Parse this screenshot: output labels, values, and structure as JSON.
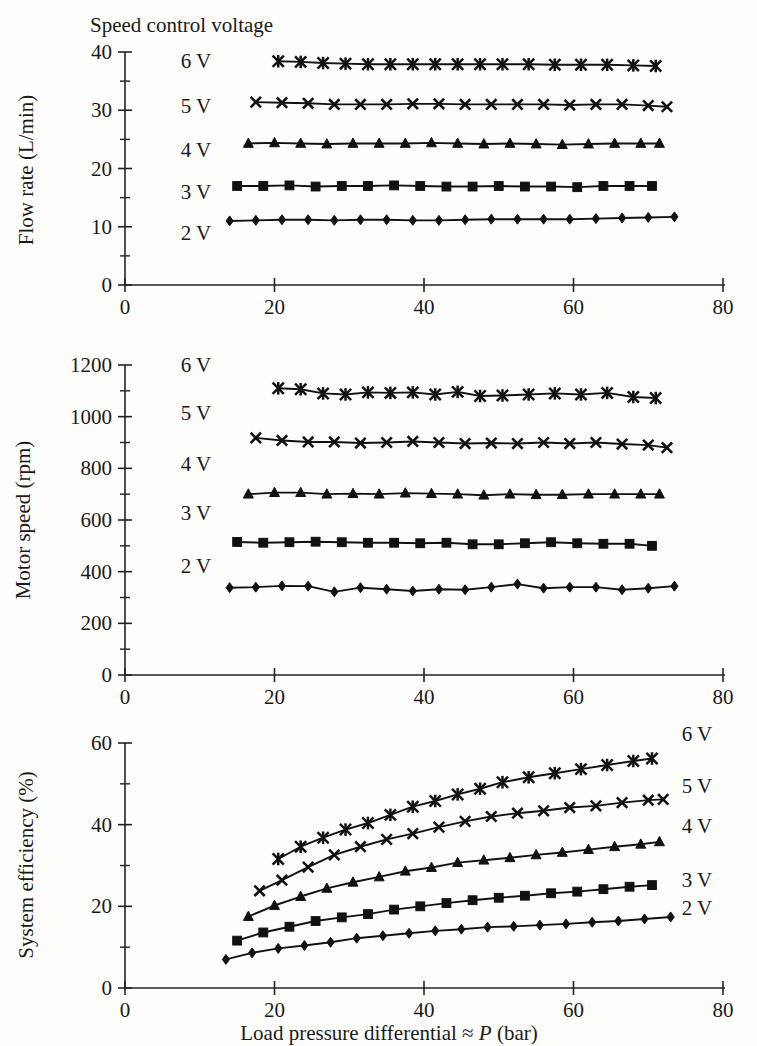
{
  "figure": {
    "legend_title": "Speed control voltage",
    "xlabel_parts": {
      "pre": "Load pressure differential ",
      "approx": "≈ ",
      "symbol": "P",
      "post": " (bar)"
    },
    "xlabel_full": "Load pressure differential ≈ P (bar)",
    "series_labels": [
      "2 V",
      "3 V",
      "4 V",
      "5 V",
      "6 V"
    ],
    "ink_color": "#111111"
  },
  "panels": {
    "flow": {
      "ylabel": "Flow rate (L/min)",
      "xticks": [
        "0",
        "20",
        "40",
        "60",
        "80"
      ],
      "yticks": [
        "0",
        "10",
        "20",
        "30",
        "40"
      ],
      "labels": {
        "v6": "6 V",
        "v5": "5 V",
        "v4": "4 V",
        "v3": "3 V",
        "v2": "2 V"
      }
    },
    "speed": {
      "ylabel": "Motor speed (rpm)",
      "xticks": [
        "0",
        "20",
        "40",
        "60",
        "80"
      ],
      "yticks": [
        "0",
        "200",
        "400",
        "600",
        "800",
        "1000",
        "1200"
      ],
      "labels": {
        "v6": "6 V",
        "v5": "5 V",
        "v4": "4 V",
        "v3": "3 V",
        "v2": "2 V"
      }
    },
    "efficiency": {
      "ylabel": "System efficiency (%)",
      "xticks": [
        "0",
        "20",
        "40",
        "60",
        "80"
      ],
      "yticks": [
        "0",
        "20",
        "40",
        "60"
      ],
      "labels": {
        "v6": "6 V",
        "v5": "5 V",
        "v4": "4 V",
        "v3": "3 V",
        "v2": "2 V"
      }
    }
  },
  "chart_data": [
    {
      "type": "line",
      "id": "flow",
      "title": "",
      "xlabel": "Load pressure differential ≈ P (bar)",
      "ylabel": "Flow rate (L/min)",
      "xlim": [
        0,
        80
      ],
      "ylim": [
        0,
        40
      ],
      "xticks": [
        0,
        20,
        40,
        60,
        80
      ],
      "yticks": [
        0,
        10,
        20,
        30,
        40
      ],
      "yminor_step": 5,
      "grid": false,
      "legend_position": "inside-left",
      "series": [
        {
          "name": "2 V",
          "marker": "diamond",
          "x": [
            14.0,
            17.5,
            21.0,
            24.5,
            28.0,
            31.5,
            35.0,
            38.5,
            42.0,
            45.5,
            49.0,
            52.5,
            56.0,
            59.5,
            63.0,
            66.5,
            70.0,
            73.5
          ],
          "y": [
            11.0,
            11.1,
            11.2,
            11.2,
            11.1,
            11.2,
            11.2,
            11.1,
            11.1,
            11.2,
            11.3,
            11.3,
            11.3,
            11.3,
            11.4,
            11.5,
            11.6,
            11.7
          ]
        },
        {
          "name": "3 V",
          "marker": "square",
          "x": [
            15.0,
            18.5,
            22.0,
            25.5,
            29.0,
            32.5,
            36.0,
            39.5,
            43.0,
            46.5,
            50.0,
            53.5,
            57.0,
            60.5,
            64.0,
            67.5,
            70.5
          ],
          "y": [
            17.0,
            17.0,
            17.1,
            16.9,
            17.0,
            17.0,
            17.1,
            17.0,
            16.9,
            16.9,
            17.0,
            16.9,
            16.9,
            16.8,
            17.0,
            17.0,
            17.0
          ]
        },
        {
          "name": "4 V",
          "marker": "triangle",
          "x": [
            16.5,
            20.0,
            23.5,
            27.0,
            30.5,
            34.0,
            37.5,
            41.0,
            44.5,
            48.0,
            51.5,
            55.0,
            58.5,
            62.0,
            65.5,
            69.0,
            71.5
          ],
          "y": [
            24.3,
            24.4,
            24.3,
            24.2,
            24.3,
            24.3,
            24.3,
            24.4,
            24.3,
            24.2,
            24.3,
            24.2,
            24.1,
            24.2,
            24.3,
            24.3,
            24.3
          ]
        },
        {
          "name": "5 V",
          "marker": "x",
          "x": [
            17.5,
            21.0,
            24.5,
            28.0,
            31.5,
            35.0,
            38.5,
            42.0,
            45.5,
            49.0,
            52.5,
            56.0,
            59.5,
            63.0,
            66.5,
            70.0,
            72.5
          ],
          "y": [
            31.4,
            31.3,
            31.2,
            31.0,
            31.0,
            31.0,
            31.1,
            31.1,
            31.0,
            31.0,
            31.0,
            31.0,
            30.9,
            31.0,
            31.0,
            30.8,
            30.6
          ]
        },
        {
          "name": "6 V",
          "marker": "star",
          "x": [
            20.5,
            23.5,
            26.5,
            29.5,
            32.5,
            35.5,
            38.5,
            41.5,
            44.5,
            47.5,
            50.5,
            54.0,
            57.5,
            61.0,
            64.5,
            68.0,
            71.0
          ],
          "y": [
            38.4,
            38.3,
            38.1,
            38.0,
            37.9,
            37.9,
            37.9,
            37.9,
            37.9,
            37.9,
            37.9,
            37.9,
            37.8,
            37.8,
            37.8,
            37.7,
            37.6
          ]
        }
      ]
    },
    {
      "type": "line",
      "id": "speed",
      "title": "",
      "xlabel": "Load pressure differential ≈ P (bar)",
      "ylabel": "Motor speed (rpm)",
      "xlim": [
        0,
        80
      ],
      "ylim": [
        0,
        1200
      ],
      "xticks": [
        0,
        20,
        40,
        60,
        80
      ],
      "yticks": [
        0,
        200,
        400,
        600,
        800,
        1000,
        1200
      ],
      "yminor_step": 100,
      "grid": false,
      "legend_position": "inside-left",
      "series": [
        {
          "name": "2 V",
          "marker": "diamond",
          "x": [
            14.0,
            17.5,
            21.0,
            24.5,
            28.0,
            31.5,
            35.0,
            38.5,
            42.0,
            45.5,
            49.0,
            52.5,
            56.0,
            59.5,
            63.0,
            66.5,
            70.0,
            73.5
          ],
          "y": [
            338,
            340,
            345,
            344,
            322,
            338,
            332,
            325,
            332,
            330,
            340,
            352,
            336,
            340,
            340,
            330,
            336,
            344
          ]
        },
        {
          "name": "3 V",
          "marker": "square",
          "x": [
            15.0,
            18.5,
            22.0,
            25.5,
            29.0,
            32.5,
            36.0,
            39.5,
            43.0,
            46.5,
            50.0,
            53.5,
            57.0,
            60.5,
            64.0,
            67.5,
            70.5
          ],
          "y": [
            515,
            512,
            514,
            516,
            514,
            512,
            512,
            510,
            512,
            506,
            506,
            510,
            514,
            510,
            508,
            508,
            500
          ]
        },
        {
          "name": "4 V",
          "marker": "triangle",
          "x": [
            16.5,
            20.0,
            23.5,
            27.0,
            30.5,
            34.0,
            37.5,
            41.0,
            44.5,
            48.0,
            51.5,
            55.0,
            58.5,
            62.0,
            65.5,
            69.0,
            71.5
          ],
          "y": [
            700,
            706,
            706,
            700,
            702,
            700,
            704,
            702,
            700,
            696,
            700,
            698,
            698,
            700,
            700,
            700,
            700
          ]
        },
        {
          "name": "5 V",
          "marker": "x",
          "x": [
            17.5,
            21.0,
            24.5,
            28.0,
            31.5,
            35.0,
            38.5,
            42.0,
            45.5,
            49.0,
            52.5,
            56.0,
            59.5,
            63.0,
            66.5,
            70.0,
            72.5
          ],
          "y": [
            918,
            908,
            902,
            902,
            898,
            900,
            904,
            900,
            896,
            898,
            896,
            900,
            896,
            900,
            894,
            890,
            880
          ]
        },
        {
          "name": "6 V",
          "marker": "star",
          "x": [
            20.5,
            23.5,
            26.5,
            29.5,
            32.5,
            35.5,
            38.5,
            41.5,
            44.5,
            47.5,
            50.5,
            54.0,
            57.5,
            61.0,
            64.5,
            68.0,
            71.0
          ],
          "y": [
            1110,
            1106,
            1090,
            1086,
            1094,
            1092,
            1094,
            1086,
            1096,
            1080,
            1082,
            1086,
            1090,
            1086,
            1092,
            1076,
            1072
          ]
        }
      ]
    },
    {
      "type": "line",
      "id": "efficiency",
      "title": "",
      "xlabel": "Load pressure differential ≈ P (bar)",
      "ylabel": "System efficiency (%)",
      "xlim": [
        0,
        80
      ],
      "ylim": [
        0,
        60
      ],
      "xticks": [
        0,
        20,
        40,
        60,
        80
      ],
      "yticks": [
        0,
        20,
        40,
        60
      ],
      "yminor_step": 10,
      "grid": false,
      "legend_position": "right-of-lines",
      "series": [
        {
          "name": "2 V",
          "marker": "diamond",
          "x": [
            13.5,
            17.0,
            20.5,
            24.0,
            27.5,
            31.0,
            34.5,
            38.0,
            41.5,
            45.0,
            48.5,
            52.0,
            55.5,
            59.0,
            62.5,
            66.0,
            69.5,
            73.0
          ],
          "y": [
            7.0,
            8.6,
            9.7,
            10.4,
            11.2,
            12.2,
            12.8,
            13.4,
            14.0,
            14.4,
            14.9,
            15.1,
            15.4,
            15.7,
            16.1,
            16.4,
            16.9,
            17.4
          ]
        },
        {
          "name": "3 V",
          "marker": "square",
          "x": [
            15.0,
            18.5,
            22.0,
            25.5,
            29.0,
            32.5,
            36.0,
            39.5,
            43.0,
            46.5,
            50.0,
            53.5,
            57.0,
            60.5,
            64.0,
            67.5,
            70.5
          ],
          "y": [
            11.6,
            13.6,
            15.0,
            16.4,
            17.3,
            18.1,
            19.2,
            20.0,
            20.8,
            21.5,
            22.1,
            22.6,
            23.2,
            23.6,
            24.2,
            24.8,
            25.2
          ]
        },
        {
          "name": "4 V",
          "marker": "triangle",
          "x": [
            16.5,
            20.0,
            23.5,
            27.0,
            30.5,
            34.0,
            37.5,
            41.0,
            44.5,
            48.0,
            51.5,
            55.0,
            58.5,
            62.0,
            65.5,
            69.0,
            71.5
          ],
          "y": [
            17.5,
            20.2,
            22.4,
            24.4,
            25.9,
            27.2,
            28.6,
            29.5,
            30.7,
            31.3,
            31.9,
            32.6,
            33.2,
            33.9,
            34.6,
            35.2,
            35.8
          ]
        },
        {
          "name": "5 V",
          "marker": "x",
          "x": [
            18.0,
            21.0,
            24.5,
            28.0,
            31.5,
            35.0,
            38.5,
            42.0,
            45.5,
            49.0,
            52.5,
            56.0,
            59.5,
            63.0,
            66.5,
            70.0,
            72.0
          ],
          "y": [
            23.8,
            26.4,
            29.6,
            32.6,
            34.6,
            36.4,
            37.8,
            39.4,
            40.8,
            42.0,
            42.8,
            43.4,
            44.2,
            44.6,
            45.4,
            46.0,
            46.2
          ]
        },
        {
          "name": "6 V",
          "marker": "star",
          "x": [
            20.5,
            23.5,
            26.5,
            29.5,
            32.5,
            35.5,
            38.5,
            41.5,
            44.5,
            47.5,
            50.5,
            54.0,
            57.5,
            61.0,
            64.5,
            68.0,
            70.5
          ],
          "y": [
            31.6,
            34.6,
            36.8,
            38.8,
            40.4,
            42.4,
            44.4,
            45.8,
            47.4,
            48.8,
            50.4,
            51.6,
            52.6,
            53.6,
            54.6,
            55.6,
            56.2
          ]
        }
      ]
    }
  ]
}
